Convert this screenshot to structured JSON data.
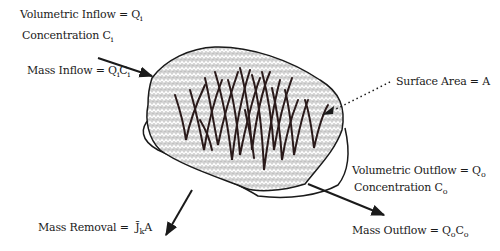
{
  "diagram": {
    "type": "wetland mass balance schematic",
    "labels": {
      "volumetric_inflow": {
        "text": "Volumetric Inflow = Q",
        "sub": "i"
      },
      "concentration_in": {
        "text": "Concentration C",
        "sub": "i"
      },
      "mass_inflow": {
        "text": "Mass Inflow = Q",
        "sub1": "i",
        "mid": "C",
        "sub2": "i"
      },
      "surface_area": {
        "text": "Surface Area = A"
      },
      "volumetric_outflow": {
        "text": "Volumetric Outflow = Q",
        "sub": "o"
      },
      "concentration_out": {
        "text": "Concentration C",
        "sub": "o"
      },
      "mass_outflow": {
        "text": "Mass Outflow = Q",
        "sub1": "o",
        "mid": "C",
        "sub2": "o"
      },
      "mass_removal": {
        "text": "Mass Removal = ",
        "symbol": "J̄",
        "sub": "k",
        "tail": "A"
      }
    },
    "arrows": [
      {
        "name": "inflow-arrow",
        "from": [
          98,
          58
        ],
        "to": [
          152,
          76
        ]
      },
      {
        "name": "outflow-arrow",
        "from": [
          308,
          184
        ],
        "to": [
          384,
          215
        ]
      },
      {
        "name": "removal-arrow",
        "from": [
          192,
          190
        ],
        "to": [
          166,
          235
        ]
      },
      {
        "name": "surface-area-leader",
        "from": [
          390,
          82
        ],
        "to": [
          330,
          112
        ],
        "style": "dotted"
      }
    ],
    "colors": {
      "ink": "#1a1a1a",
      "water_fill": "#c8c8c8",
      "background": "#ffffff"
    }
  }
}
